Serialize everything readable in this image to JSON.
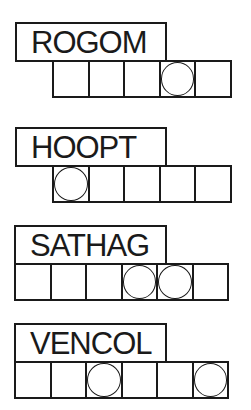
{
  "puzzles": [
    {
      "scrambled": "ROGOM",
      "box_count": 5,
      "circled_positions": [
        4
      ],
      "label_left": 15,
      "label_top": 22,
      "label_width": 152,
      "row_left": 52,
      "row_top": 60
    },
    {
      "scrambled": "HOOPT",
      "box_count": 5,
      "circled_positions": [
        1
      ],
      "label_left": 15,
      "label_top": 127,
      "label_width": 152,
      "row_left": 52,
      "row_top": 165
    },
    {
      "scrambled": "SATHAG",
      "box_count": 6,
      "circled_positions": [
        4,
        5
      ],
      "label_left": 14,
      "label_top": 225,
      "label_width": 153,
      "row_left": 14,
      "row_top": 263
    },
    {
      "scrambled": "VENCOL",
      "box_count": 6,
      "circled_positions": [
        3,
        6
      ],
      "label_left": 14,
      "label_top": 323,
      "label_width": 153,
      "row_left": 14,
      "row_top": 361
    }
  ],
  "colors": {
    "ink": "#1a1a1a",
    "paper": "#ffffff"
  }
}
